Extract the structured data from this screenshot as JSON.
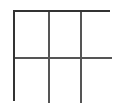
{
  "figure": {
    "kind": "grid-outline",
    "columns": 3,
    "rows": 2,
    "cells_total": 6,
    "cell_labels": [
      "",
      "",
      "",
      "",
      "",
      ""
    ],
    "geometry": {
      "canvas_width_px": 120,
      "canvas_height_px": 108,
      "left_px": 13,
      "top_px": 10,
      "width_px": 97,
      "height_px": 91,
      "column_x_px": [
        13,
        46,
        78,
        110
      ],
      "row_y_px": [
        10,
        55,
        101
      ],
      "outer_border_width_px": 2,
      "inner_divider_width_px": 2
    },
    "colors": {
      "page_background": "#ffffff",
      "cell_fill": "#ffffff",
      "outer_border": "#333333",
      "inner_divider": "#555555"
    }
  }
}
